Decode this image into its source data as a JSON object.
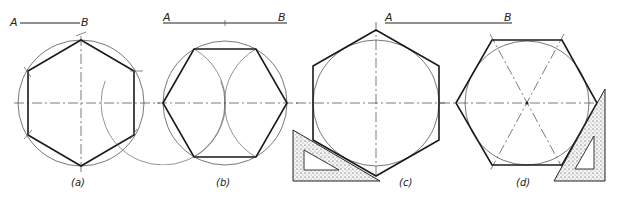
{
  "figures": [
    {
      "id": "a",
      "caption": "(a)",
      "segment": {
        "start_label": "A",
        "end_label": "B"
      },
      "description": "Hexagon inscribed in circle by stepping off radius AB (pointy top)"
    },
    {
      "id": "b",
      "caption": "(b)",
      "segment": {
        "start_label": "A",
        "end_label": "B"
      },
      "description": "Hexagon inscribed in circle using arcs from diameter ends (flat top)"
    },
    {
      "id": "c",
      "caption": "(c)",
      "segment": {
        "start_label": "A",
        "end_label": "B"
      },
      "description": "Hexagon circumscribed about circle using 30-60 set square (pointy top)"
    },
    {
      "id": "d",
      "caption": "(d)",
      "segment": {
        "start_label": "A",
        "end_label": "B"
      },
      "description": "Hexagon circumscribed about circle using 30-60 set square (flat top)"
    }
  ],
  "colors": {
    "line": "#1a1a1a",
    "construction": "#555555",
    "background": "#ffffff"
  }
}
